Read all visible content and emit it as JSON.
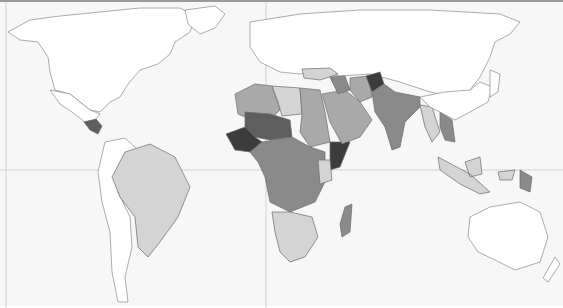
{
  "map": {
    "type": "choropleth-world-map",
    "projection": "equirectangular",
    "palette": {
      "background": "#f7f7f7",
      "no_data": "#ffffff",
      "level_1": "#d4d4d4",
      "level_2": "#a9a9a9",
      "level_3": "#8a8a8a",
      "level_4": "#5e5e5e",
      "level_5": "#3c3c3c",
      "border": "#6a6a6a",
      "gridline": "#c8c8c8"
    },
    "gridlines": {
      "equator_y": 168,
      "prime_meridian_x": 266
    },
    "regions": [
      {
        "name": "North America",
        "level": "no_data"
      },
      {
        "name": "Central America (Guatemala/Honduras)",
        "level": "level_4"
      },
      {
        "name": "South America (Andes west)",
        "level": "no_data"
      },
      {
        "name": "Brazil / Bolivia / Peru",
        "level": "level_1"
      },
      {
        "name": "Europe / Russia",
        "level": "no_data"
      },
      {
        "name": "North Africa (Morocco/Algeria)",
        "level": "level_2"
      },
      {
        "name": "Libya",
        "level": "level_1"
      },
      {
        "name": "Egypt / Sudan",
        "level": "level_2"
      },
      {
        "name": "Mali / Niger",
        "level": "level_4"
      },
      {
        "name": "West Africa coast",
        "level": "level_5"
      },
      {
        "name": "Central Africa",
        "level": "level_3"
      },
      {
        "name": "Somalia / Horn",
        "level": "level_5"
      },
      {
        "name": "East Africa (Kenya)",
        "level": "level_1"
      },
      {
        "name": "Southern Africa",
        "level": "level_1"
      },
      {
        "name": "Angola / Zambia",
        "level": "level_3"
      },
      {
        "name": "Madagascar",
        "level": "level_3"
      },
      {
        "name": "Arabian Peninsula",
        "level": "level_2"
      },
      {
        "name": "Turkey / Caucasus",
        "level": "level_1"
      },
      {
        "name": "Iraq",
        "level": "level_3"
      },
      {
        "name": "Afghanistan",
        "level": "level_5"
      },
      {
        "name": "Pakistan / India",
        "level": "level_3"
      },
      {
        "name": "Myanmar / Thailand",
        "level": "level_1"
      },
      {
        "name": "Laos / Cambodia",
        "level": "level_3"
      },
      {
        "name": "Indonesia",
        "level": "level_1"
      },
      {
        "name": "Papua New Guinea",
        "level": "level_3"
      },
      {
        "name": "China / East Asia",
        "level": "no_data"
      },
      {
        "name": "Australia / NZ",
        "level": "no_data"
      }
    ]
  }
}
